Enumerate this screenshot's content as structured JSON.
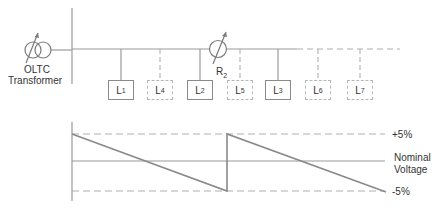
{
  "diagram": {
    "transformer_label_line1": "OLTC",
    "transformer_label_line2": "Transformer",
    "regulator_label": "R",
    "regulator_sub": "2",
    "loads": [
      {
        "label": "L",
        "sub": "1",
        "style": "solid"
      },
      {
        "label": "L",
        "sub": "4",
        "style": "dashed"
      },
      {
        "label": "L",
        "sub": "2",
        "style": "solid"
      },
      {
        "label": "L",
        "sub": "5",
        "style": "dashed"
      },
      {
        "label": "L",
        "sub": "3",
        "style": "solid"
      },
      {
        "label": "L",
        "sub": "6",
        "style": "dashed"
      },
      {
        "label": "L",
        "sub": "7",
        "style": "dashed"
      }
    ]
  },
  "voltage_profile": {
    "upper_limit_label": "+5%",
    "nominal_label_line1": "Nominal",
    "nominal_label_line2": "Voltage",
    "lower_limit_label": "-5%"
  },
  "colors": {
    "line": "#8a8a8a",
    "dashed": "#b0b0b0",
    "text": "#333333"
  }
}
